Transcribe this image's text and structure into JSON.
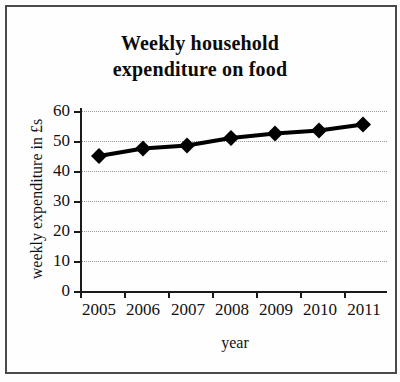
{
  "chart_data": {
    "type": "line",
    "title": "Weekly household expenditure on food",
    "title_lines": [
      "Weekly household",
      "expenditure on food"
    ],
    "xlabel": "year",
    "ylabel": "weekly expenditure in £s",
    "categories": [
      "2005",
      "2006",
      "2007",
      "2008",
      "2009",
      "2010",
      "2011"
    ],
    "values": [
      45,
      47.5,
      48.5,
      51,
      52.5,
      53.5,
      55.5
    ],
    "series": [
      {
        "name": "weekly expenditure on food",
        "values": [
          45,
          47.5,
          48.5,
          51,
          52.5,
          53.5,
          55.5
        ]
      }
    ],
    "ylim": [
      0,
      60
    ],
    "yticks": [
      0,
      10,
      20,
      30,
      40,
      50,
      60
    ],
    "ytick_labels": [
      "0",
      "10",
      "20",
      "30",
      "40",
      "50",
      "60"
    ],
    "grid": true,
    "grid_style": "dotted",
    "legend": false,
    "marker": "diamond",
    "marker_color": "#000000",
    "line_color": "#000000",
    "grid_color": "#9a9a9a",
    "axis_color": "#1a1a1a",
    "background_color": "#fefefe"
  }
}
